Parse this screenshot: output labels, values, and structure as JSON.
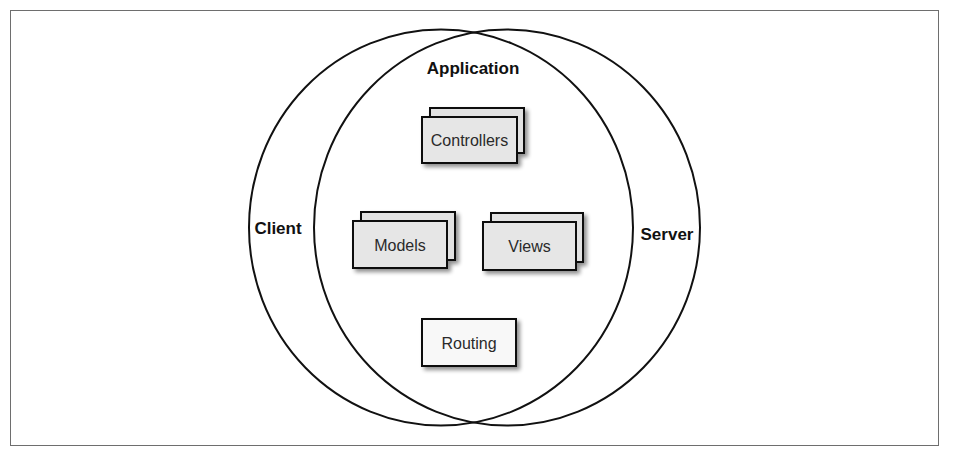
{
  "diagram": {
    "type": "venn-architecture",
    "circles": {
      "client": {
        "label": "Client"
      },
      "server": {
        "label": "Server"
      },
      "intersection": {
        "label": "Application"
      }
    },
    "components": [
      {
        "id": "controllers",
        "label": "Controllers",
        "stacked": true
      },
      {
        "id": "models",
        "label": "Models",
        "stacked": true
      },
      {
        "id": "views",
        "label": "Views",
        "stacked": true
      },
      {
        "id": "routing",
        "label": "Routing",
        "stacked": false
      }
    ],
    "colors": {
      "outline": "#111111",
      "stacked_fill": "#e6e6e6",
      "single_fill": "#f8f8f8",
      "frame": "#6e6e6e"
    }
  }
}
